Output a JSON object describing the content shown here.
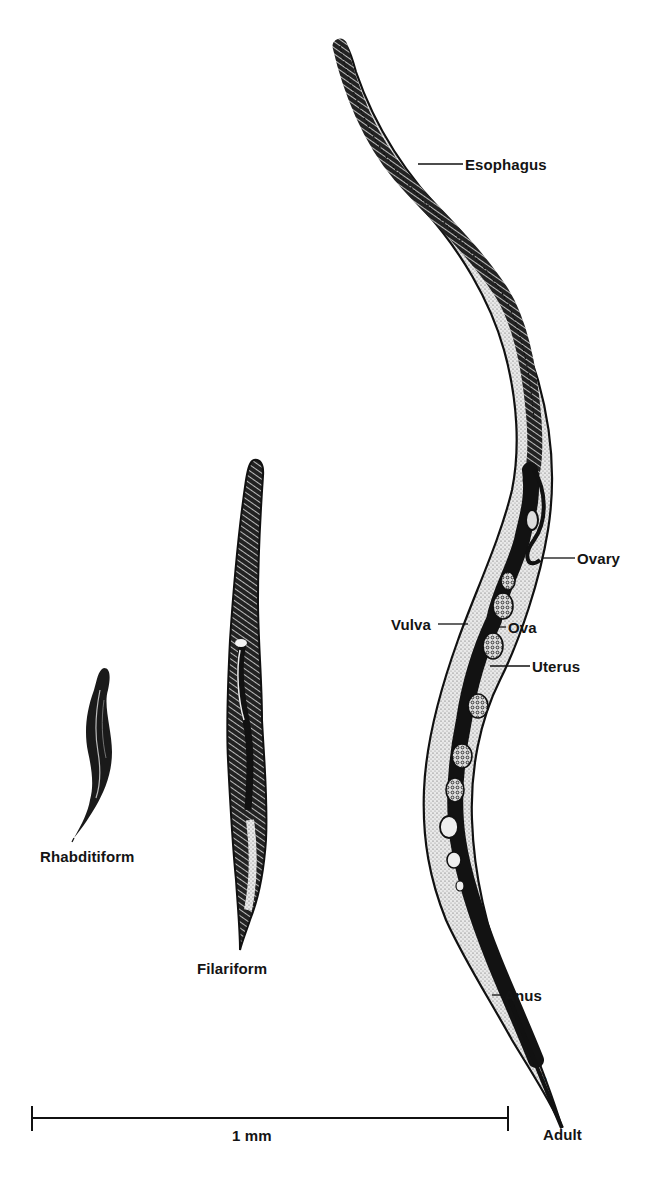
{
  "figure": {
    "stages": [
      {
        "id": "rhabditiform",
        "label": "Rhabditiform"
      },
      {
        "id": "filariform",
        "label": "Filariform"
      },
      {
        "id": "adult",
        "label": "Adult"
      }
    ],
    "anatomy_labels": {
      "esophagus": "Esophagus",
      "ovary": "Ovary",
      "vulva": "Vulva",
      "ova": "Ova",
      "uterus": "Uterus",
      "anus": "Anus"
    },
    "scale_bar": {
      "label": "1 mm"
    },
    "colors": {
      "ink": "#141414",
      "stipple": "#d9d9d9",
      "background": "#ffffff"
    }
  }
}
